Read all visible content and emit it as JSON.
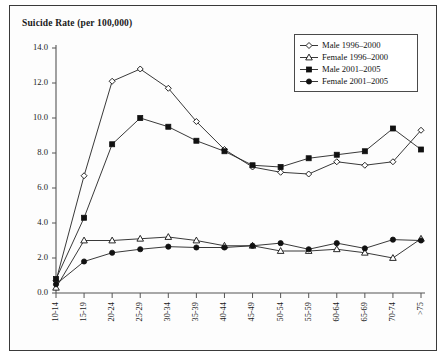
{
  "chart_data": {
    "type": "line",
    "title": "Suicide Rate (per 100,000)",
    "xlabel": "",
    "ylabel": "",
    "ylim": [
      0.0,
      14.0
    ],
    "ytick_step": 2.0,
    "yticks": [
      "0.0",
      "2.0",
      "4.0",
      "6.0",
      "8.0",
      "10.0",
      "12.0",
      "14.0"
    ],
    "grid": false,
    "legend_position": "top-right",
    "categories": [
      "10-14",
      "15-19",
      "20-24",
      "25-29",
      "30-34",
      "35-39",
      "40-44",
      "45-49",
      "50-54",
      "55-59",
      "60-64",
      "65-69",
      "70-74",
      ">75"
    ],
    "series": [
      {
        "name": "Male 1996-2000",
        "marker": "open-diamond",
        "values": [
          0.7,
          6.7,
          12.1,
          12.8,
          11.7,
          9.8,
          8.2,
          7.2,
          6.9,
          6.8,
          7.5,
          7.3,
          7.5,
          9.3
        ]
      },
      {
        "name": "Female 1996-2000",
        "marker": "open-triangle",
        "values": [
          0.3,
          3.0,
          3.0,
          3.1,
          3.2,
          3.0,
          2.7,
          2.7,
          2.4,
          2.4,
          2.5,
          2.3,
          2.0,
          3.1
        ]
      },
      {
        "name": "Male 2001-2005",
        "marker": "filled-square",
        "values": [
          0.8,
          4.3,
          8.5,
          10.0,
          9.5,
          8.7,
          8.1,
          7.3,
          7.2,
          7.7,
          7.9,
          8.1,
          9.4,
          8.2
        ]
      },
      {
        "name": "Female 2001-2005",
        "marker": "filled-circle",
        "values": [
          0.5,
          1.8,
          2.3,
          2.5,
          2.65,
          2.6,
          2.6,
          2.7,
          2.85,
          2.5,
          2.85,
          2.55,
          3.05,
          3.0
        ]
      }
    ]
  },
  "legend": {
    "entries": [
      {
        "label": "Male 1996–2000",
        "marker": "open-diamond"
      },
      {
        "label": "Female 1996–2000",
        "marker": "open-triangle"
      },
      {
        "label": "Male 2001–2005",
        "marker": "filled-square"
      },
      {
        "label": "Female 2001–2005",
        "marker": "filled-circle"
      }
    ]
  }
}
